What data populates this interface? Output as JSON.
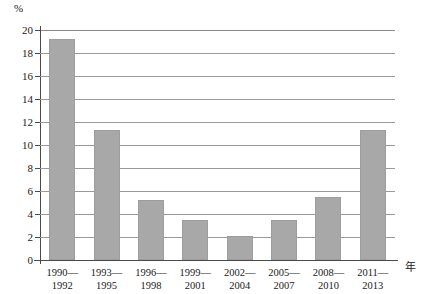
{
  "chart_data": {
    "type": "bar",
    "title": "",
    "xlabel": "年",
    "ylabel": "%",
    "ylim": [
      0,
      20
    ],
    "ytick_step": 2,
    "yticks": [
      20,
      18,
      16,
      14,
      12,
      10,
      8,
      6,
      4,
      2,
      0
    ],
    "grid": true,
    "legend": false,
    "bar_color": "#a8a8a8",
    "categories": [
      "1990—1992",
      "1993—1995",
      "1996—1998",
      "1999—2001",
      "2002—2004",
      "2005—2007",
      "2008—2010",
      "2011—2013"
    ],
    "category_lines": [
      [
        "1990—",
        "1992"
      ],
      [
        "1993—",
        "1995"
      ],
      [
        "1996—",
        "1998"
      ],
      [
        "1999—",
        "2001"
      ],
      [
        "2002—",
        "2004"
      ],
      [
        "2005—",
        "2007"
      ],
      [
        "2008—",
        "2010"
      ],
      [
        "2011—",
        "2013"
      ]
    ],
    "values": [
      19.2,
      11.3,
      5.2,
      3.5,
      2.1,
      3.5,
      5.5,
      11.3
    ]
  }
}
